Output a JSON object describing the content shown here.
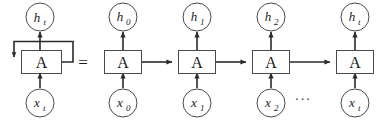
{
  "figure": {
    "background_color": "#ffffff",
    "stroke_color": "#2b2b2b",
    "outline_color": "#4a4a4a",
    "text_color": "#1a1a1a",
    "equals_sign": "=",
    "ellipsis": "···"
  },
  "folded": {
    "cell_label": "A",
    "output": {
      "base": "h",
      "subscript": "t"
    },
    "input": {
      "base": "x",
      "subscript": "t"
    },
    "has_self_loop": true
  },
  "unrolled": {
    "steps": [
      {
        "cell_label": "A",
        "output": {
          "base": "h",
          "subscript": "0"
        },
        "input": {
          "base": "x",
          "subscript": "0"
        },
        "incoming_arrow": false,
        "outgoing_arrow": true
      },
      {
        "cell_label": "A",
        "output": {
          "base": "h",
          "subscript": "1"
        },
        "input": {
          "base": "x",
          "subscript": "1"
        },
        "incoming_arrow": true,
        "outgoing_arrow": true
      },
      {
        "cell_label": "A",
        "output": {
          "base": "h",
          "subscript": "2"
        },
        "input": {
          "base": "x",
          "subscript": "2"
        },
        "incoming_arrow": true,
        "outgoing_arrow": true
      },
      {
        "cell_label": "A",
        "output": {
          "base": "h",
          "subscript": "t"
        },
        "input": {
          "base": "x",
          "subscript": "t"
        },
        "incoming_arrow": true,
        "outgoing_arrow": false
      }
    ]
  }
}
